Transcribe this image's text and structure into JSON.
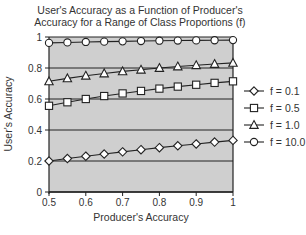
{
  "chart_data": {
    "type": "line",
    "title": "User's Accuracy as a Function of Producer's Accuracy for a Range of Class Proportions (f)",
    "title_lines": [
      "User's Accuracy as a Function of Producer's",
      "Accuracy for a Range of Class Proportions (f)"
    ],
    "xlabel": "Producer's Accuracy",
    "ylabel": "User's Accuracy",
    "xlim": [
      0.5,
      1.0
    ],
    "ylim": [
      0,
      1
    ],
    "xticks": [
      "0.5",
      "0.6",
      "0.7",
      "0.8",
      "0.9",
      "1"
    ],
    "yticks": [
      "0",
      "0.2",
      "0.4",
      "0.6",
      "0.8",
      "1"
    ],
    "grid": "horizontal",
    "legend_position": "right",
    "x": [
      0.5,
      0.55,
      0.6,
      0.65,
      0.7,
      0.75,
      0.8,
      0.85,
      0.9,
      0.95,
      1.0
    ],
    "series": [
      {
        "name": "f = 0.1",
        "marker": "diamond",
        "values": [
          0.2,
          0.216,
          0.231,
          0.245,
          0.259,
          0.273,
          0.286,
          0.298,
          0.31,
          0.322,
          0.333
        ]
      },
      {
        "name": "f = 0.5",
        "marker": "square",
        "values": [
          0.556,
          0.579,
          0.6,
          0.619,
          0.636,
          0.652,
          0.667,
          0.68,
          0.692,
          0.704,
          0.714
        ]
      },
      {
        "name": "f = 1.0",
        "marker": "triangle",
        "values": [
          0.714,
          0.733,
          0.75,
          0.765,
          0.778,
          0.789,
          0.8,
          0.81,
          0.818,
          0.826,
          0.833
        ]
      },
      {
        "name": "f = 10.0",
        "marker": "circle",
        "values": [
          0.962,
          0.965,
          0.968,
          0.97,
          0.972,
          0.974,
          0.976,
          0.977,
          0.978,
          0.979,
          0.98
        ]
      }
    ]
  },
  "colors": {
    "plot_background": "#cfcfcf",
    "line": "#222222",
    "marker_fill": "#ffffff",
    "text": "#333333"
  }
}
